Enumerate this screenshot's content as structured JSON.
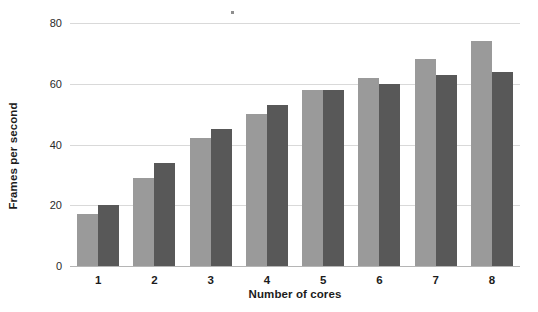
{
  "chart_data": {
    "type": "bar",
    "title": "",
    "xlabel": "Number of cores",
    "ylabel": "Frames per second",
    "categories": [
      "1",
      "2",
      "3",
      "4",
      "5",
      "6",
      "7",
      "8"
    ],
    "series": [
      {
        "name": "series-a",
        "color": "#9a9a9a",
        "values": [
          17,
          29,
          42,
          50,
          58,
          62,
          68,
          74
        ]
      },
      {
        "name": "series-b",
        "color": "#585858",
        "values": [
          20,
          34,
          45,
          53,
          58,
          60,
          63,
          64
        ]
      }
    ],
    "ylim": [
      0,
      80
    ],
    "yticks": [
      0,
      20,
      40,
      60,
      80
    ],
    "ytick_labels": [
      "0",
      "20",
      "40",
      "60",
      "80"
    ],
    "grid": true,
    "legend": "none",
    "background": "#ffffff",
    "annotations": [
      "small speck artifact near top center"
    ]
  }
}
